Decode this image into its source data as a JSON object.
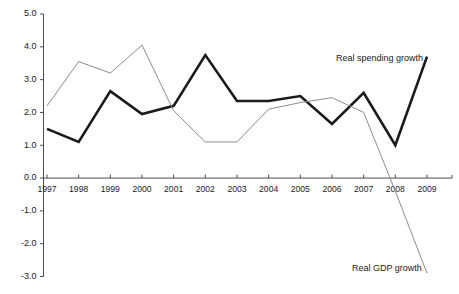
{
  "chart_data": {
    "type": "line",
    "title": "",
    "subtitle": "",
    "xlabel": "",
    "ylabel": "",
    "grid": false,
    "legend_position": "inline-annotations",
    "categories": [
      "1997",
      "1998",
      "1999",
      "2000",
      "2001",
      "2002",
      "2003",
      "2004",
      "2005",
      "2006",
      "2007",
      "2008",
      "2009"
    ],
    "ylim": [
      -3.0,
      5.0
    ],
    "ytick_labels": [
      "5.0",
      "4.0",
      "3.0",
      "2.0",
      "1.0",
      "0.0",
      "-1.0",
      "-2.0",
      "-3.0"
    ],
    "ytick_values": [
      5.0,
      4.0,
      3.0,
      2.0,
      1.0,
      0.0,
      -1.0,
      -2.0,
      -3.0
    ],
    "series": [
      {
        "name": "Real spending growth",
        "style": "bold-black",
        "color": "#1a1a1a",
        "values": [
          1.5,
          1.1,
          2.65,
          1.95,
          2.2,
          3.75,
          2.35,
          2.35,
          2.5,
          1.65,
          2.6,
          1.0,
          3.7
        ]
      },
      {
        "name": "Real GDP growth",
        "style": "thin-gray",
        "color": "#8c8c8c",
        "values": [
          2.2,
          3.55,
          3.2,
          4.05,
          2.05,
          1.1,
          1.1,
          2.1,
          2.3,
          2.45,
          2.0,
          -0.4,
          -2.9
        ]
      }
    ],
    "annotations": [
      {
        "text": "Real spending growth",
        "series": "Real spending growth"
      },
      {
        "text": "Real GDP growth",
        "series": "Real GDP growth"
      }
    ]
  },
  "colors": {
    "background": "#ffffff",
    "axis": "#4d4d4d",
    "spending_line": "#1a1a1a",
    "gdp_line": "#8c8c8c",
    "text": "#1a1a1a"
  }
}
